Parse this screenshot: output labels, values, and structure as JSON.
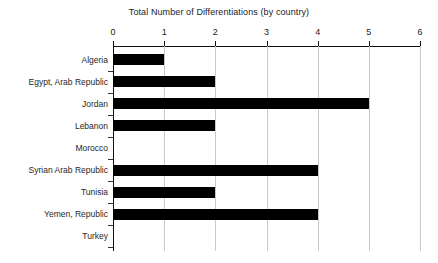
{
  "chart_data": {
    "type": "bar",
    "orientation": "horizontal",
    "title": "Total Number of Differentiations (by country)",
    "xlabel": "",
    "ylabel": "",
    "xlim": [
      0,
      6
    ],
    "xticks": [
      0,
      1,
      2,
      3,
      4,
      5,
      6
    ],
    "xtick_labels": [
      "0",
      "1",
      "2",
      "3",
      "4",
      "5",
      "6"
    ],
    "grid": true,
    "grid_axis": "x",
    "legend": false,
    "bar_color": "#000000",
    "grid_color": "#c9c9c9",
    "axis_color": "#111111",
    "categories": [
      "Algeria",
      "Egypt, Arab Republic",
      "Jordan",
      "Lebanon",
      "Morocco",
      "Syrian Arab Republic",
      "Tunisia",
      "Yemen, Republic",
      "Turkey"
    ],
    "values": [
      1,
      2,
      5,
      2,
      0,
      4,
      2,
      4,
      0
    ]
  }
}
